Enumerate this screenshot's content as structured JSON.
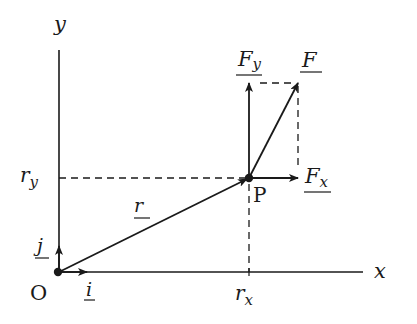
{
  "diagram": {
    "axes": {
      "x_label": "x",
      "y_label": "y",
      "origin_label": "O"
    },
    "unit_vectors": {
      "i_label": "i",
      "j_label": "j"
    },
    "position_vector": {
      "label": "r",
      "point_label": "P",
      "rx_label": "r",
      "rx_sub": "x",
      "ry_label": "r",
      "ry_sub": "y"
    },
    "force": {
      "F_label": "F",
      "Fx_label": "F",
      "Fx_sub": "x",
      "Fy_label": "F",
      "Fy_sub": "y"
    },
    "colors": {
      "ink": "#1a1a1a",
      "background": "#ffffff"
    }
  }
}
